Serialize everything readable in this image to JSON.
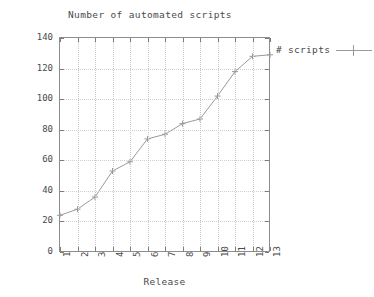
{
  "chart_data": {
    "type": "line",
    "title": "Number of automated scripts",
    "xlabel": "Release",
    "ylabel": "# scripts",
    "categories": [
      "1",
      "2",
      "3",
      "4",
      "5",
      "6",
      "7",
      "8",
      "9",
      "10",
      "11",
      "12",
      "13"
    ],
    "x": [
      1,
      2,
      3,
      4,
      5,
      6,
      7,
      8,
      9,
      10,
      11,
      12,
      13
    ],
    "series": [
      {
        "name": "# scripts",
        "values": [
          24,
          28,
          36,
          53,
          59,
          74,
          77,
          84,
          87,
          102,
          118,
          128,
          129
        ]
      }
    ],
    "ylim": [
      0,
      140
    ],
    "xlim": [
      1,
      13
    ],
    "yticks": [
      0,
      20,
      40,
      60,
      80,
      100,
      120,
      140
    ],
    "ytick_labels": [
      "0",
      "20",
      "40",
      "60",
      "80",
      "100",
      "120",
      "140"
    ],
    "xtick_labels": [
      "1",
      "2",
      "3",
      "4",
      "5",
      "6",
      "7",
      "8",
      "9",
      "10",
      "11",
      "12",
      "13"
    ],
    "grid": true,
    "legend_position": "top-right-outside",
    "legend_entries": [
      "# scripts"
    ],
    "marker": "plus",
    "line_color": "#9a9a9a",
    "grid_color": "#c9c9c9",
    "axis_color": "#8c8c8c",
    "text_color": "#4a4a4a",
    "background_color": "#ffffff"
  },
  "legend": {
    "label": "# scripts",
    "marker_icon": "plus-line-marker-icon"
  }
}
